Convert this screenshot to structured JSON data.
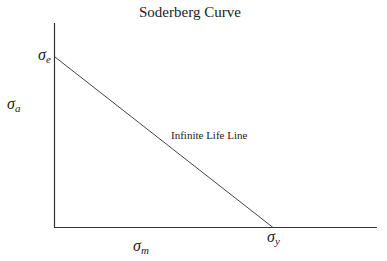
{
  "title": "Soderberg Curve",
  "axes": {
    "y_label": {
      "symbol": "σ",
      "sub": "a"
    },
    "x_label": {
      "symbol": "σ",
      "sub": "m"
    }
  },
  "intercepts": {
    "y": {
      "symbol": "σ",
      "sub": "e"
    },
    "x": {
      "symbol": "σ",
      "sub": "y"
    }
  },
  "line_label": "Infinite Life Line",
  "colors": {
    "line": "#333333",
    "background": "#ffffff"
  }
}
